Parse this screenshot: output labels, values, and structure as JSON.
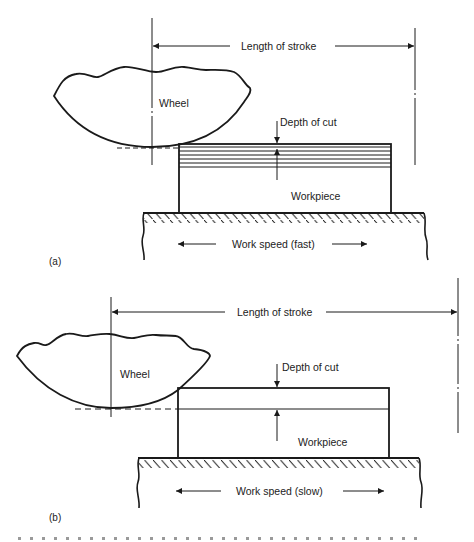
{
  "figure": {
    "panel_a": {
      "panel_label": "(a)",
      "dimension_label": "Length of stroke",
      "wheel_label": "Wheel",
      "depth_label": "Depth of cut",
      "workpiece_label": "Workpiece",
      "speed_label": "Work speed (fast)"
    },
    "panel_b": {
      "panel_label": "(b)",
      "dimension_label": "Length of stroke",
      "wheel_label": "Wheel",
      "depth_label": "Depth of cut",
      "workpiece_label": "Workpiece",
      "speed_label": "Work speed (slow)"
    },
    "caption_visible": false
  },
  "colors": {
    "line": "#1a1a1a",
    "background": "#ffffff",
    "text": "#222222"
  }
}
